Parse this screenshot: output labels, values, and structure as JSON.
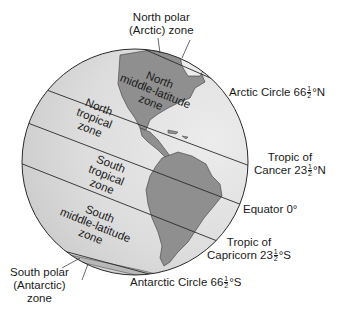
{
  "diagram": {
    "type": "globe-latitude-zones",
    "colors": {
      "ocean": "#d2d2d2",
      "ocean_light": "#e6e6e6",
      "land": "#8f8f8f",
      "land_light": "#ececec",
      "outline": "#2a2a2a"
    },
    "zones": [
      {
        "id": "north-polar",
        "lines": [
          "North polar",
          "(Arctic) zone"
        ]
      },
      {
        "id": "north-mid",
        "lines": [
          "North",
          "middle-latitude",
          "zone"
        ]
      },
      {
        "id": "north-tropical",
        "lines": [
          "North",
          "tropical",
          "zone"
        ]
      },
      {
        "id": "south-tropical",
        "lines": [
          "South",
          "tropical",
          "zone"
        ]
      },
      {
        "id": "south-mid",
        "lines": [
          "South",
          "middle-latitude",
          "zone"
        ]
      },
      {
        "id": "south-polar",
        "lines": [
          "South polar",
          "(Antarctic)",
          "zone"
        ]
      }
    ],
    "latitude_lines": {
      "arctic": {
        "name": "Arctic Circle",
        "deg": "66",
        "frac_num": "1",
        "frac_den": "2",
        "suffix": "°N"
      },
      "cancer": {
        "line1": "Tropic of",
        "name": "Cancer",
        "deg": "23",
        "frac_num": "1",
        "frac_den": "2",
        "suffix": "°N"
      },
      "equator": {
        "label": "Equator 0°"
      },
      "capricorn": {
        "line1": "Tropic of",
        "name": "Capricorn",
        "deg": "23",
        "frac_num": "1",
        "frac_den": "2",
        "suffix": "°S"
      },
      "antarctic": {
        "name": "Antarctic Circle",
        "deg": "66",
        "frac_num": "1",
        "frac_den": "2",
        "suffix": "°S"
      }
    }
  }
}
